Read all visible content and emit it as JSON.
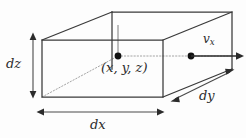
{
  "figure": {
    "type": "3d-box-diagram",
    "background_color": "#fdfdfd",
    "line_color": "#3a3a3a",
    "dot_color": "#111111"
  },
  "labels": {
    "dz": "dz",
    "dx": "dx",
    "dy": "dy",
    "velocity_base": "v",
    "velocity_sub": "x",
    "center_point": "(x, y, z)"
  },
  "geometry": {
    "front_face": {
      "top_left": [
        42,
        40
      ],
      "top_right": [
        163,
        40
      ],
      "bottom_right": [
        163,
        97
      ],
      "bottom_left": [
        42,
        97
      ]
    },
    "back_face": {
      "top_left": [
        112,
        12
      ],
      "top_right": [
        232,
        12
      ],
      "bottom_right": [
        232,
        69
      ],
      "bottom_left": [
        112,
        69
      ]
    },
    "center_dot": [
      118,
      56
    ],
    "velocity_dot": [
      191,
      56
    ],
    "velocity_arrow_tip": [
      243,
      56
    ]
  },
  "dimension_arrows": {
    "dz": {
      "from": [
        33,
        34
      ],
      "to": [
        33,
        97
      ],
      "orientation": "vertical"
    },
    "dx": {
      "from": [
        38,
        112
      ],
      "to": [
        163,
        112
      ],
      "orientation": "horizontal"
    },
    "dy": {
      "from": [
        172,
        101
      ],
      "to": [
        233,
        70
      ],
      "orientation": "diagonal"
    }
  }
}
